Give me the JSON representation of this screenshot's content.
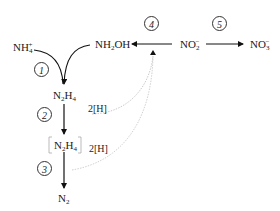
{
  "diagram": {
    "species": {
      "ammonium": {
        "base": "NH",
        "sub": "4",
        "sup": "+"
      },
      "hydroxylamine": {
        "base": "NH",
        "sub": "2",
        "tail": "OH"
      },
      "nitrite": {
        "base": "NO",
        "sub": "2",
        "sup": "−"
      },
      "nitrate": {
        "base": "NO",
        "sub": "3",
        "sup": "−"
      },
      "hydrazine": {
        "base1": "N",
        "sub1": "2",
        "base2": "H",
        "sub2": "4"
      },
      "hydrazine_bracket": {
        "base1": "N",
        "sub1": "2",
        "base2": "H",
        "sub2": "4"
      },
      "dinitrogen": {
        "base": "N",
        "sub": "2"
      }
    },
    "steps": [
      "1",
      "2",
      "3",
      "4",
      "5"
    ],
    "reducing_equivalents": [
      "2[H]",
      "2[H]"
    ],
    "colors": {
      "solid_arrow": "#111111",
      "dotted_curve": "#b5b5b5"
    }
  }
}
